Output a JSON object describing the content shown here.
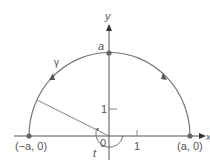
{
  "diagram": {
    "type": "semicircle contour in the complex plane",
    "axes": {
      "x_label": "x",
      "y_label": "y"
    },
    "origin_label": "0",
    "ticks": {
      "x_one": "1",
      "y_one": "1"
    },
    "points": {
      "left": "(−a, 0)",
      "right": "(a, 0)",
      "top": "a"
    },
    "curve_label": "γ",
    "angle_label": "t",
    "colors": {
      "curve": "#707070",
      "axis": "#555555",
      "point": "#666666",
      "text": "#555555"
    }
  }
}
